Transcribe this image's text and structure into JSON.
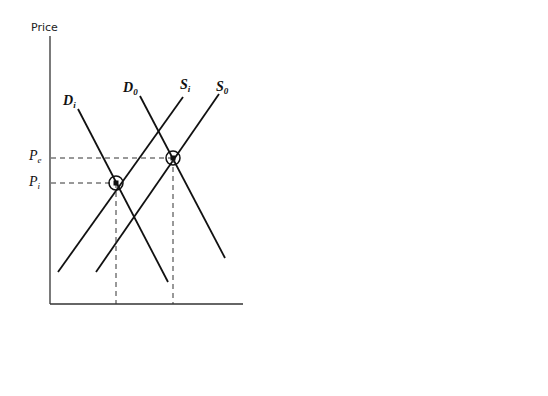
{
  "panels": [
    {
      "id": "a",
      "caption": "(a)",
      "y_axis_label": "Price",
      "x_axis_label": "Quantity",
      "origin_label": "O",
      "curves": {
        "Di": {
          "main": "D",
          "sub": "i"
        },
        "D0": {
          "main": "D",
          "sub": "0"
        },
        "Si": {
          "main": "S",
          "sub": "i"
        },
        "S0": {
          "main": "S",
          "sub": "0"
        }
      },
      "price_ticks": [
        {
          "main": "P",
          "sub": "e",
          "order": "upper"
        },
        {
          "main": "P",
          "sub": "i",
          "order": "lower"
        }
      ],
      "quantity_ticks": [
        {
          "main": "Q",
          "sub": "i"
        },
        {
          "main": "Q",
          "sub": "e"
        }
      ]
    },
    {
      "id": "b",
      "caption": "(b)",
      "y_axis_label": "Price",
      "x_axis_label": "Quantity",
      "origin_label": "O",
      "curves": {
        "Di": {
          "main": "D",
          "sub": "i"
        },
        "D0": {
          "main": "D",
          "sub": "0"
        },
        "Si": {
          "main": "S",
          "sub": "i"
        },
        "S0": {
          "main": "S",
          "sub": "0"
        }
      },
      "price_ticks": [
        {
          "main": "P",
          "sub": "i",
          "order": "upper"
        },
        {
          "main": "P",
          "sub": "e",
          "order": "lower"
        }
      ],
      "quantity_ticks": [
        {
          "main": "Q",
          "sub": "i"
        },
        {
          "main": "Q",
          "sub": "e"
        }
      ]
    }
  ]
}
